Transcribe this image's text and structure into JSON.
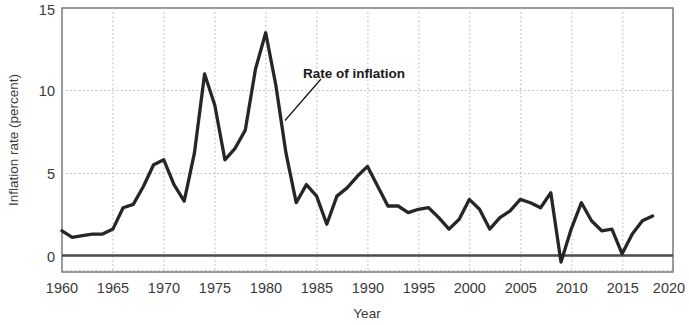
{
  "chart_data": {
    "type": "line",
    "title": "",
    "xlabel": "Year",
    "ylabel": "Inflation rate (percent)",
    "xlim": [
      1960,
      2020
    ],
    "ylim": [
      -1,
      15
    ],
    "xticks": [
      1960,
      1965,
      1970,
      1975,
      1980,
      1985,
      1990,
      1995,
      2000,
      2005,
      2010,
      2015,
      2020
    ],
    "yticks": [
      0,
      5,
      10,
      15
    ],
    "grid": "dotted gridlines at y = 5 and y = 10, and at every 5-year x tick",
    "legend": "none",
    "zero_reference_line": 0,
    "annotations": [
      {
        "text": "Rate of inflation",
        "points_to_year": 1982,
        "points_to_value": 7.2
      }
    ],
    "series": [
      {
        "name": "Rate of inflation",
        "color": "#262626",
        "x": [
          1960,
          1961,
          1962,
          1963,
          1964,
          1965,
          1966,
          1967,
          1968,
          1969,
          1970,
          1971,
          1972,
          1973,
          1974,
          1975,
          1976,
          1977,
          1978,
          1979,
          1980,
          1981,
          1982,
          1983,
          1984,
          1985,
          1986,
          1987,
          1988,
          1989,
          1990,
          1991,
          1992,
          1993,
          1994,
          1995,
          1996,
          1997,
          1998,
          1999,
          2000,
          2001,
          2002,
          2003,
          2004,
          2005,
          2006,
          2007,
          2008,
          2009,
          2010,
          2011,
          2012,
          2013,
          2014,
          2015,
          2016,
          2017,
          2018
        ],
        "values": [
          1.5,
          1.1,
          1.2,
          1.3,
          1.3,
          1.6,
          2.9,
          3.1,
          4.2,
          5.5,
          5.8,
          4.3,
          3.3,
          6.2,
          11.0,
          9.1,
          5.8,
          6.5,
          7.6,
          11.3,
          13.5,
          10.3,
          6.2,
          3.2,
          4.3,
          3.6,
          1.9,
          3.6,
          4.1,
          4.8,
          5.4,
          4.2,
          3.0,
          3.0,
          2.6,
          2.8,
          2.9,
          2.3,
          1.6,
          2.2,
          3.4,
          2.8,
          1.6,
          2.3,
          2.7,
          3.4,
          3.2,
          2.9,
          3.8,
          -0.4,
          1.6,
          3.2,
          2.1,
          1.5,
          1.6,
          0.1,
          1.3,
          2.1,
          2.4
        ]
      }
    ]
  },
  "axes": {
    "x_tick_labels": [
      "1960",
      "1965",
      "1970",
      "1975",
      "1980",
      "1985",
      "1990",
      "1995",
      "2000",
      "2005",
      "2010",
      "2015",
      "2020"
    ],
    "y_tick_labels": [
      "0",
      "5",
      "10",
      "15"
    ],
    "x_axis_title": "Year",
    "y_axis_title": "Inflation rate (percent)"
  },
  "annotation": {
    "label": "Rate of inflation"
  },
  "colors": {
    "line": "#262626",
    "grid": "#b9b9b9",
    "frame": "#6f6f6f",
    "zero_line": "#4a4a4a",
    "text": "#3a3a3a",
    "background": "#ffffff"
  }
}
